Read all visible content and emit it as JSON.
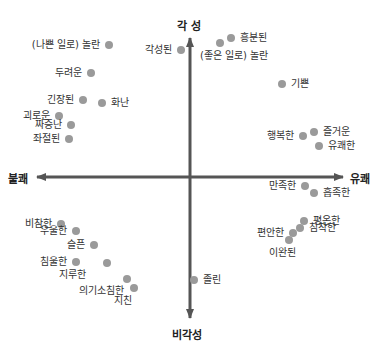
{
  "diagram": {
    "title": "",
    "axes": {
      "top": "각 성",
      "bottom": "비각성",
      "left": "불쾌",
      "right": "유쾌"
    },
    "colors": {
      "axis": "#555555",
      "dot": "#9a9a9a",
      "text": "#333333"
    },
    "points": [
      {
        "label": "(나쁜 일로) 놀란",
        "x": 109,
        "y": 45,
        "side": "left"
      },
      {
        "label": "두려운",
        "x": 91,
        "y": 73,
        "side": "left"
      },
      {
        "label": "긴장된",
        "x": 83,
        "y": 100,
        "side": "left"
      },
      {
        "label": "화난",
        "x": 102,
        "y": 103,
        "side": "right"
      },
      {
        "label": "괴로운",
        "x": 59,
        "y": 116,
        "side": "left"
      },
      {
        "label": "짜증난",
        "x": 71,
        "y": 125,
        "side": "left"
      },
      {
        "label": "좌절된",
        "x": 69,
        "y": 139,
        "side": "left"
      },
      {
        "label": "각성된",
        "x": 181,
        "y": 50,
        "side": "left"
      },
      {
        "label": "(좋은 일로) 놀란",
        "x": 220,
        "y": 43,
        "side": "below"
      },
      {
        "label": "흥분된",
        "x": 231,
        "y": 38,
        "side": "right"
      },
      {
        "label": "기쁜",
        "x": 282,
        "y": 84,
        "side": "right"
      },
      {
        "label": "행복한",
        "x": 303,
        "y": 136,
        "side": "left"
      },
      {
        "label": "즐거운",
        "x": 314,
        "y": 132,
        "side": "right"
      },
      {
        "label": "유쾌한",
        "x": 319,
        "y": 146,
        "side": "right"
      },
      {
        "label": "만족한",
        "x": 305,
        "y": 186,
        "side": "left"
      },
      {
        "label": "흡족한",
        "x": 314,
        "y": 193,
        "side": "right"
      },
      {
        "label": "평온한",
        "x": 304,
        "y": 221,
        "side": "right"
      },
      {
        "label": "침착한",
        "x": 300,
        "y": 228,
        "side": "right"
      },
      {
        "label": "편안한",
        "x": 293,
        "y": 233,
        "side": "left"
      },
      {
        "label": "이완된",
        "x": 289,
        "y": 240,
        "side": "below"
      },
      {
        "label": "비참한",
        "x": 61,
        "y": 224,
        "side": "left"
      },
      {
        "label": "우울한",
        "x": 76,
        "y": 231,
        "side": "left"
      },
      {
        "label": "슬픈",
        "x": 94,
        "y": 245,
        "side": "left"
      },
      {
        "label": "침울한",
        "x": 76,
        "y": 262,
        "side": "left"
      },
      {
        "label": "지루한",
        "x": 107,
        "y": 263,
        "side": "belowleft"
      },
      {
        "label": "의기소침한",
        "x": 127,
        "y": 279,
        "side": "belowleft"
      },
      {
        "label": "지친",
        "x": 134,
        "y": 288,
        "side": "below"
      },
      {
        "label": "졸린",
        "x": 194,
        "y": 280,
        "side": "right"
      }
    ]
  }
}
